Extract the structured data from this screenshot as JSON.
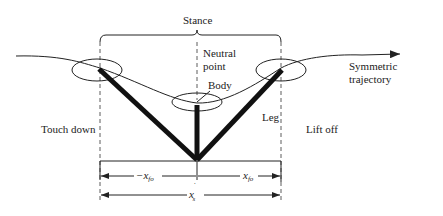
{
  "diagram": {
    "labels": {
      "stance": "Stance",
      "neutral_point_line1": "Neutral",
      "neutral_point_line2": "point",
      "body": "Body",
      "symmetric_line1": "Symmetric",
      "symmetric_line2": "trajectory",
      "touch_down": "Touch down",
      "leg": "Leg",
      "lift_off": "Lift off",
      "x_fo_neg": "−x",
      "x_fo_neg_sub": "fo",
      "x_fo": "x",
      "x_fo_sub": "fo",
      "x_s": "x",
      "x_s_sup": "˙",
      "x_s_sub": "s"
    }
  }
}
